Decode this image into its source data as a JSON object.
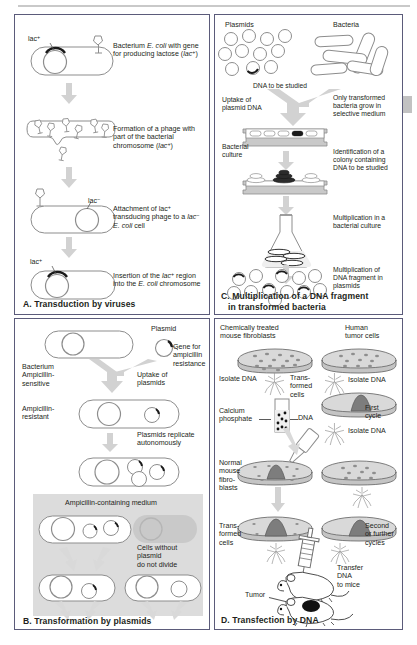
{
  "figure": {
    "type": "four-panel biology diagram",
    "page_marker": "right-edge-gray-tab"
  },
  "panel_a": {
    "title": "A. Transduction by viruses",
    "labels": {
      "lac_plus_1": "lac",
      "lac_plus_1_sup": "+",
      "lac_minus": "lac",
      "lac_minus_sup": "−",
      "lac_plus_2": "lac",
      "lac_plus_2_sup": "+"
    },
    "steps": [
      {
        "id": "step-1",
        "text_parts": [
          "Bacterium ",
          "E. coli",
          " with gene for producing lactose (",
          "lac",
          "+",
          ")"
        ],
        "plain": "Bacterium E. coli with gene for producing lactose (lac+)"
      },
      {
        "id": "step-2",
        "plain": "Formation of a phage with part of the bacterial chromosome (lac+)"
      },
      {
        "id": "step-3",
        "plain": "Attachment of lac+ transducing phage to a lac− E. coli cell"
      },
      {
        "id": "step-4",
        "plain": "Insertion of the lac+ region into the E. coli chromosome"
      }
    ]
  },
  "panel_b": {
    "title": "B. Transformation by plasmids",
    "labels": {
      "plasmid": "Plasmid",
      "gene_for_resistance": "Gene for ampicillin resistance",
      "bacterium_sensitive": "Bacterium Ampicillin- sensitive",
      "uptake": "Uptake of plasmids",
      "resistant": "Ampicillin- resistant",
      "replicate": "Plasmids replicate autonomously",
      "medium": "Ampicillin-containing medium",
      "no_plasmid": "Cells without plasmid do not divide"
    }
  },
  "panel_c": {
    "title_line1": "C. Multiplication of a DNA fragment",
    "title_line2": "in transformed bacteria",
    "labels": {
      "plasmids": "Plasmids",
      "bacteria": "Bacteria",
      "dna_to_be_studied": "DNA to be studied",
      "uptake": "Uptake of plasmid DNA",
      "bacterial_culture": "Bacterial culture",
      "only_transformed": "Only transformed bacteria grow in selective medium",
      "identification": "Identification of a colony containing DNA to be studied",
      "multiplication_culture": "Multiplication in a bacterial culture",
      "multiplication_plasmids": "Multiplication of DNA fragment in plasmids"
    }
  },
  "panel_d": {
    "title": "D. Transfection by DNA",
    "labels": {
      "chem_treated": "Chemically treated mouse fibroblasts",
      "human_tumor": "Human tumor cells",
      "isolate_dna_left": "Isolate DNA",
      "transformed_cells_top": "Trans- formed cells",
      "isolate_dna_right": "Isolate DNA",
      "calcium_phosphate": "Calcium phosphate",
      "dna": "DNA",
      "first_cycle": "First cycle",
      "isolate_dna_mid": "Isolate DNA",
      "normal_fibroblasts": "Normal mouse fibro- blasts",
      "transformed_cells_bottom": "Trans- formed cells",
      "second_cycles": "Second or further cycles",
      "transfer_to_mice": "Transfer DNA to mice",
      "tumor": "Tumor"
    }
  },
  "colors": {
    "panel_border": "#5b5b7a",
    "outline": "#8d8d8d",
    "arrow": "#cfcfcf",
    "grey_box": "#dcdcdc",
    "text": "#231f20",
    "dish_fill": "#d9d9d9",
    "colony": "#7a7a7a"
  }
}
